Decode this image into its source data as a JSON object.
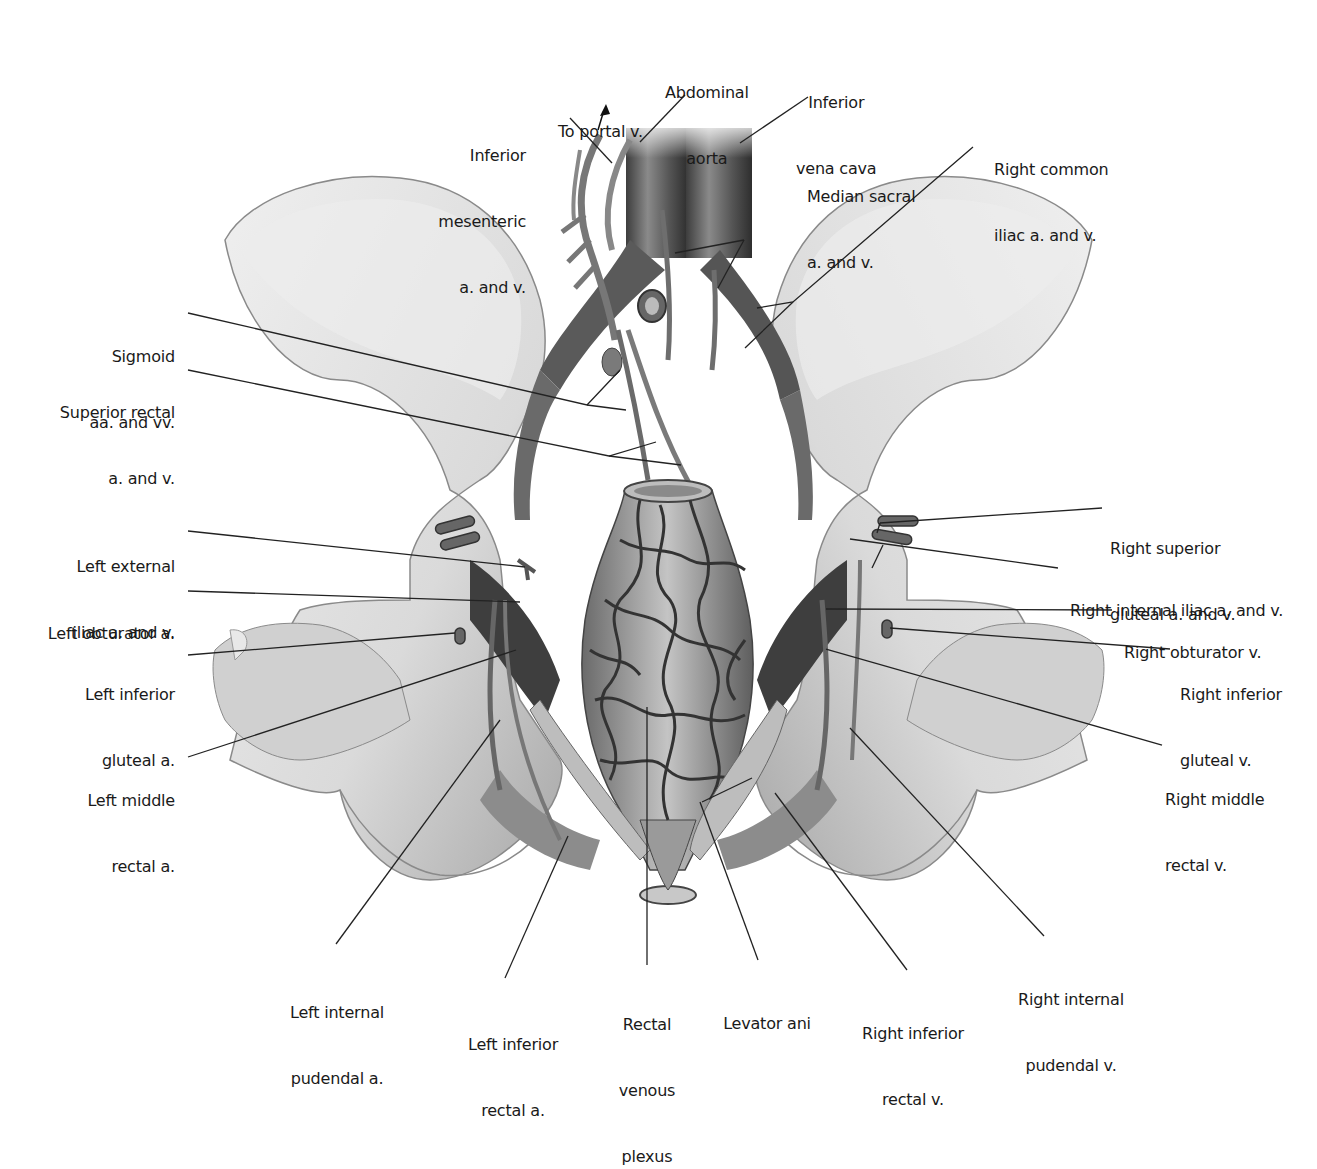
{
  "figure": {
    "palette": {
      "background": "#ffffff",
      "bone_light": "#e6e6e6",
      "bone_mid": "#c9c9c9",
      "bone_shadow": "#9a9a9a",
      "vessel_dark": "#4a4a4a",
      "vessel_mid": "#6e6e6e",
      "vessel_light": "#8f8f8f",
      "rectum": "#b5b5b5",
      "text": "#1a1a1a",
      "leader": "#222222"
    }
  },
  "labels": {
    "to_portal_v": {
      "lines": [
        "To portal v."
      ]
    },
    "abdominal_aorta": {
      "lines": [
        "Abdominal",
        "aorta"
      ]
    },
    "inferior_vena_cava": {
      "lines": [
        "Inferior",
        "vena cava"
      ]
    },
    "inferior_mesenteric": {
      "lines": [
        "Inferior",
        "mesenteric",
        "a. and v."
      ]
    },
    "right_common_iliac": {
      "lines": [
        "Right common",
        "iliac a. and v."
      ]
    },
    "median_sacral": {
      "lines": [
        "Median sacral",
        "a. and v."
      ]
    },
    "sigmoid": {
      "lines": [
        "Sigmoid",
        "aa. and vv."
      ]
    },
    "superior_rectal": {
      "lines": [
        "Superior rectal",
        "a. and v."
      ]
    },
    "left_external_iliac": {
      "lines": [
        "Left external",
        "iliac a. and v."
      ]
    },
    "left_obturator": {
      "lines": [
        "Left obturator a."
      ]
    },
    "left_inferior_gluteal": {
      "lines": [
        "Left inferior",
        "gluteal a."
      ]
    },
    "left_middle_rectal": {
      "lines": [
        "Left middle",
        "rectal a."
      ]
    },
    "right_superior_gluteal": {
      "lines": [
        "Right superior",
        "gluteal a. and v."
      ]
    },
    "right_internal_iliac": {
      "lines": [
        "Right internal iliac a. and v."
      ]
    },
    "right_obturator": {
      "lines": [
        "Right obturator v."
      ]
    },
    "right_inferior_gluteal": {
      "lines": [
        "Right inferior",
        "gluteal v."
      ]
    },
    "right_middle_rectal": {
      "lines": [
        "Right middle",
        "rectal v."
      ]
    },
    "left_internal_pudendal": {
      "lines": [
        "Left internal",
        "pudendal a."
      ]
    },
    "left_inferior_rectal": {
      "lines": [
        "Left inferior",
        "rectal a."
      ]
    },
    "rectal_venous_plexus": {
      "lines": [
        "Rectal",
        "venous",
        "plexus"
      ]
    },
    "levator_ani": {
      "lines": [
        "Levator ani"
      ]
    },
    "right_inferior_rectal": {
      "lines": [
        "Right inferior",
        "rectal v."
      ]
    },
    "right_internal_pudendal": {
      "lines": [
        "Right internal",
        "pudendal v."
      ]
    }
  }
}
